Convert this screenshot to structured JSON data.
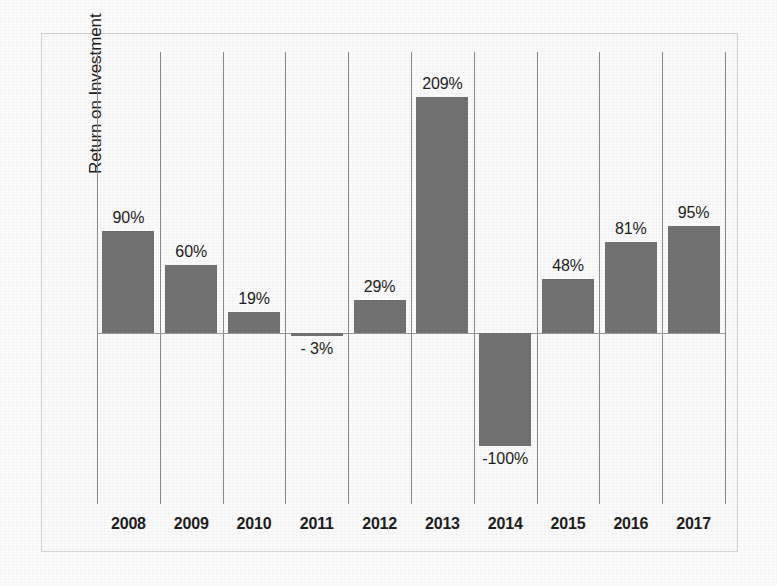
{
  "chart_data": {
    "type": "bar",
    "title": "",
    "subtitle": "",
    "xlabel": "",
    "ylabel": "Return on Investment",
    "categories": [
      "2008",
      "2009",
      "2010",
      "2011",
      "2012",
      "2013",
      "2014",
      "2015",
      "2016",
      "2017"
    ],
    "values": [
      90,
      60,
      19,
      -3,
      29,
      209,
      -100,
      48,
      81,
      95
    ],
    "data_labels": [
      "90%",
      "60%",
      "19%",
      "- 3%",
      "29%",
      "209%",
      "-100%",
      "48%",
      "81%",
      "95%"
    ],
    "ylim": [
      -160,
      249
    ],
    "grid": "vertical-category-separators",
    "legend": "none",
    "series": [
      {
        "name": "Return on Investment",
        "values": [
          90,
          60,
          19,
          -3,
          29,
          209,
          -100,
          48,
          81,
          95
        ]
      }
    ],
    "colors": {
      "bar": "#727272",
      "plot_background": "#fbfbfb",
      "gridline": "#8a8a8a",
      "border": "#d2d2d2",
      "text": "#1d1d1d"
    },
    "axis": {
      "y_tick_labels": [],
      "x_tick_labels": [
        "2008",
        "2009",
        "2010",
        "2011",
        "2012",
        "2013",
        "2014",
        "2015",
        "2016",
        "2017"
      ],
      "zero_line_visible": true,
      "y_axis_values_hidden": true
    }
  }
}
